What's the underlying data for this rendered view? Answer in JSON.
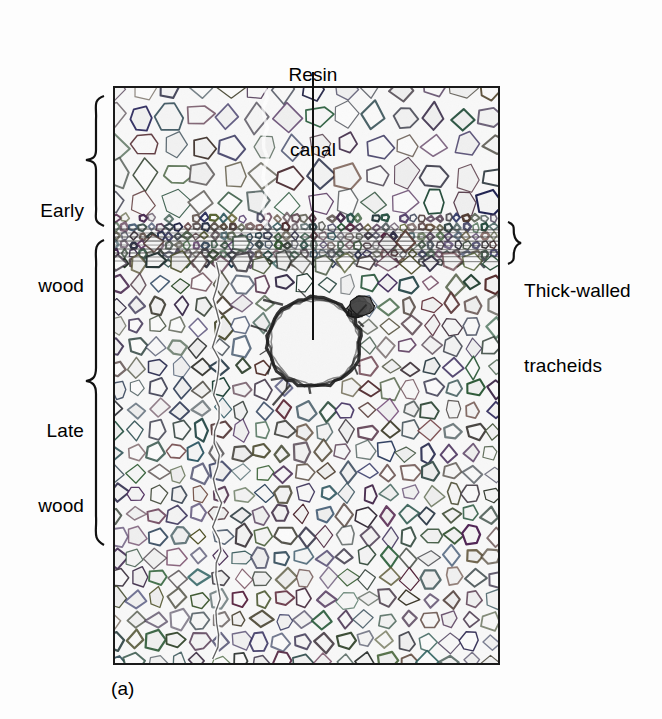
{
  "figure": {
    "caption": "(a)",
    "background_color": "#fdfdfd",
    "ink_color": "#111111"
  },
  "annotations": {
    "resin_canal": {
      "line1": "Resin",
      "line2": "canal",
      "leader": "vertical-line-to-canal-center"
    },
    "early_wood": {
      "line1": "Early",
      "line2": "wood",
      "brace": "right-facing-curly-brace"
    },
    "late_wood": {
      "line1": "Late",
      "line2": "wood",
      "brace": "right-facing-curly-brace"
    },
    "thick_walled_tracheids": {
      "line1": "Thick-walled",
      "line2": "tracheids",
      "brace": "left-facing-curly-brace"
    }
  },
  "micrograph": {
    "panel": {
      "x": 113,
      "y": 86,
      "width": 387,
      "height": 579
    },
    "zones": [
      {
        "name": "early-wood",
        "y_start": 0,
        "y_end": 139,
        "cell_size": 29,
        "wall_weight": 1.5,
        "fill": "#f4f4f4"
      },
      {
        "name": "thick-walled-tracheids",
        "y_start": 139,
        "y_end": 175,
        "cell_size": 9,
        "wall_weight": 1.9,
        "fill": "#ededed"
      },
      {
        "name": "late-wood",
        "y_start": 175,
        "y_end": 579,
        "cell_size": 21,
        "wall_weight": 1.6,
        "fill": "#f2f2f2"
      }
    ],
    "resin_canal": {
      "cx": 199,
      "cy": 254,
      "rx": 47,
      "ry": 45,
      "rim_weight": 3.2
    },
    "epithelial_blob": {
      "cx": 243,
      "cy": 220,
      "r": 13
    },
    "radial_crack": {
      "x": 102,
      "y_start": 175,
      "y_end": 579
    }
  }
}
